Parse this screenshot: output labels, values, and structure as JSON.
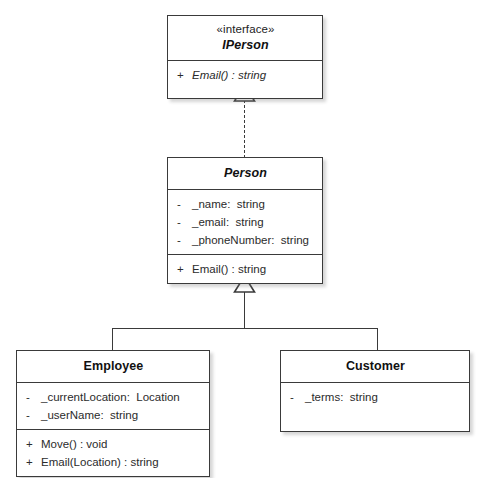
{
  "diagram": {
    "type": "uml-class-diagram",
    "background": "#ffffff",
    "line_color": "#3a3a3a",
    "classes": [
      {
        "id": "iperson",
        "stereotype": "«interface»",
        "name": "IPerson",
        "abstract": true,
        "attributes": [],
        "operations": [
          {
            "visibility": "+",
            "signature": "Email() : string",
            "italic": true
          }
        ]
      },
      {
        "id": "person",
        "stereotype": "",
        "name": "Person",
        "abstract": true,
        "attributes": [
          {
            "visibility": "-",
            "signature": "_name:  string",
            "italic": false
          },
          {
            "visibility": "-",
            "signature": "_email:  string",
            "italic": false
          },
          {
            "visibility": "-",
            "signature": "_phoneNumber:  string",
            "italic": false
          }
        ],
        "operations": [
          {
            "visibility": "+",
            "signature": "Email() : string",
            "italic": false
          }
        ]
      },
      {
        "id": "employee",
        "stereotype": "",
        "name": "Employee",
        "abstract": false,
        "attributes": [
          {
            "visibility": "-",
            "signature": "_currentLocation:  Location",
            "italic": false
          },
          {
            "visibility": "-",
            "signature": "_userName:  string",
            "italic": false
          }
        ],
        "operations": [
          {
            "visibility": "+",
            "signature": "Move() : void",
            "italic": false
          },
          {
            "visibility": "+",
            "signature": "Email(Location) : string",
            "italic": false
          }
        ]
      },
      {
        "id": "customer",
        "stereotype": "",
        "name": "Customer",
        "abstract": false,
        "attributes": [
          {
            "visibility": "-",
            "signature": "_terms:  string",
            "italic": false
          }
        ],
        "operations": []
      }
    ],
    "relationships": [
      {
        "id": "rel-person-iperson",
        "kind": "realization",
        "line": "dashed",
        "arrow": "hollow-triangle",
        "source": "person",
        "target": "iperson"
      },
      {
        "id": "rel-employee-person",
        "kind": "generalization",
        "line": "solid",
        "arrow": "hollow-triangle",
        "source": "employee",
        "target": "person"
      },
      {
        "id": "rel-customer-person",
        "kind": "generalization",
        "line": "solid",
        "arrow": "hollow-triangle",
        "source": "customer",
        "target": "person"
      }
    ]
  }
}
